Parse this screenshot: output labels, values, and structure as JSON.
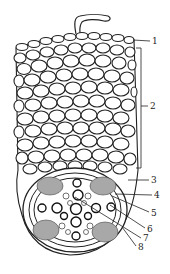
{
  "diagram": {
    "colors": {
      "cell_wall": "#222222",
      "background": "#ffffff",
      "phloem_fill": "#9a9a9a"
    },
    "labels": [
      {
        "id": "1",
        "text": "1",
        "x": 152,
        "y": 37,
        "target": [
          133,
          40
        ]
      },
      {
        "id": "2",
        "text": "2",
        "x": 150,
        "y": 102,
        "bracket": [
          48,
          168
        ]
      },
      {
        "id": "3",
        "text": "3",
        "x": 151,
        "y": 176,
        "target": [
          128,
          180
        ]
      },
      {
        "id": "4",
        "text": "4",
        "x": 154,
        "y": 191,
        "target": [
          115,
          194
        ]
      },
      {
        "id": "5",
        "text": "5",
        "x": 151,
        "y": 209,
        "target": [
          112,
          196
        ]
      },
      {
        "id": "6",
        "text": "6",
        "x": 147,
        "y": 225,
        "target": [
          110,
          205
        ]
      },
      {
        "id": "7",
        "text": "7",
        "x": 143,
        "y": 234,
        "target": [
          75,
          197
        ]
      },
      {
        "id": "8",
        "text": "8",
        "x": 138,
        "y": 243,
        "target": [
          122,
          227
        ]
      }
    ]
  }
}
